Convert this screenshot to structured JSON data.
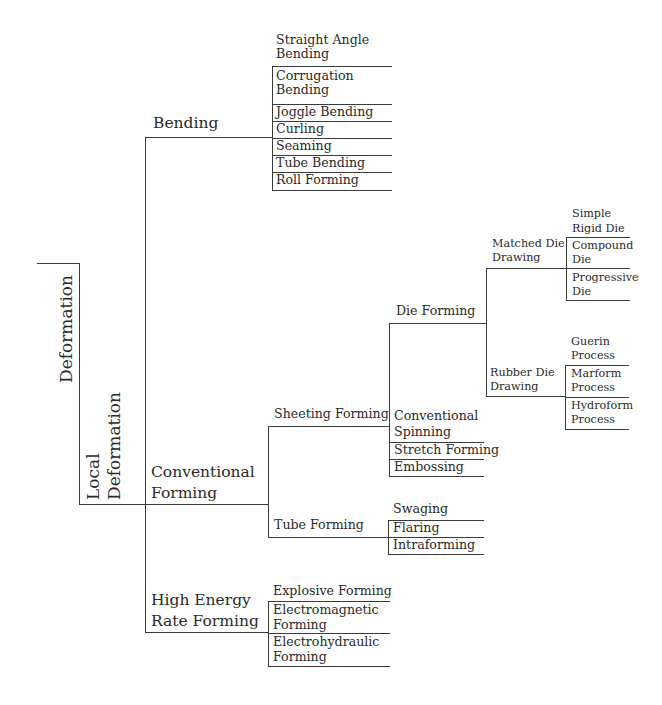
{
  "root": {
    "label": "Deformation"
  },
  "level1": {
    "label": "Local Deformation",
    "line1": "Local",
    "line2": "Deformation"
  },
  "categories": [
    {
      "label": "Bending",
      "children": [
        "Straight Angle Bending",
        "Corrugation Bending",
        "Joggle Bending",
        "Curling",
        "Seaming",
        "Tube Bending",
        "Roll Forming"
      ],
      "display": [
        [
          "Straight Angle",
          "Bending"
        ],
        [
          "Corrugation",
          "Bending"
        ],
        [
          "Joggle Bending"
        ],
        [
          "Curling"
        ],
        [
          "Seaming"
        ],
        [
          "Tube Bending"
        ],
        [
          "Roll Forming"
        ]
      ]
    },
    {
      "label": "Conventional Forming",
      "line1": "Conventional",
      "line2": "Forming",
      "children": [
        {
          "label": "Sheeting Forming",
          "children": [
            {
              "label": "Die Forming",
              "children": [
                {
                  "label": "Matched Die Drawing",
                  "line1": "Matched Die",
                  "line2": "Drawing",
                  "children": [
                    [
                      "Simple",
                      "Rigid Die"
                    ],
                    [
                      "Compound",
                      "Die"
                    ],
                    [
                      "Progressive",
                      "Die"
                    ]
                  ]
                },
                {
                  "label": "Rubber Die Drawing",
                  "line1": "Rubber Die",
                  "line2": "Drawing",
                  "children": [
                    [
                      "Guerin",
                      "Process"
                    ],
                    [
                      "Marform",
                      "Process"
                    ],
                    [
                      "Hydroform",
                      "Process"
                    ]
                  ]
                }
              ]
            },
            {
              "label": "Conventional Spinning",
              "line1": "Conventional",
              "line2": "Spinning"
            },
            {
              "label": "Stretch Forming"
            },
            {
              "label": "Embossing"
            }
          ]
        },
        {
          "label": "Tube Forming",
          "children": [
            "Swaging",
            "Flaring",
            "Intraforming"
          ]
        }
      ]
    },
    {
      "label": "High Energy Rate Forming",
      "line1": "High Energy",
      "line2": "Rate Forming",
      "children": [
        [
          "Explosive Forming"
        ],
        [
          "Electromagnetic",
          "Forming"
        ],
        [
          "Electrohydraulic",
          "Forming"
        ]
      ]
    }
  ]
}
